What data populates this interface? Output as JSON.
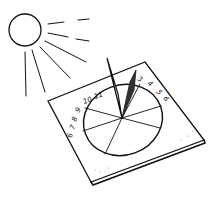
{
  "illustration": {
    "subject": "sundial",
    "sun_icon": "sun-icon",
    "hour_labels_left": [
      "6",
      "7",
      "8",
      "9",
      "10",
      "11"
    ],
    "hour_labels_right": [
      "3",
      "4",
      "5",
      "6"
    ],
    "colors": {
      "ink": "#111111",
      "background": "#ffffff"
    }
  }
}
